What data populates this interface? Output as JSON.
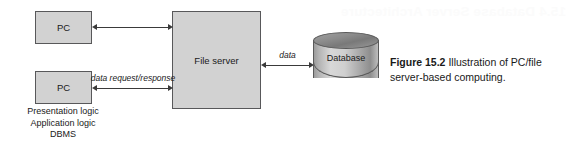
{
  "figure": {
    "ghost_text": "15.4  Database Server Architecture",
    "caption_number": "Figure 15.2",
    "caption_text": "Illustration of PC/file server-based computing.",
    "colors": {
      "node_fill": "#d2d2d2",
      "node_border": "#58585a",
      "arrow": "#3a3a3a",
      "text": "#1a1a1a",
      "background": "#ffffff"
    }
  },
  "nodes": {
    "pc_top": {
      "label": "PC"
    },
    "pc_bottom": {
      "label": "PC"
    },
    "file_server": {
      "label": "File server"
    },
    "database": {
      "label": "Database"
    }
  },
  "client_stack": {
    "lines": [
      "Presentation logic",
      "Application logic",
      "DBMS"
    ]
  },
  "edges": {
    "pc_top_to_server": {
      "label": "",
      "direction": "bidirectional"
    },
    "pc_bottom_to_server": {
      "label": "data request/response",
      "direction": "bidirectional"
    },
    "server_to_database": {
      "label": "data",
      "direction": "bidirectional"
    }
  }
}
